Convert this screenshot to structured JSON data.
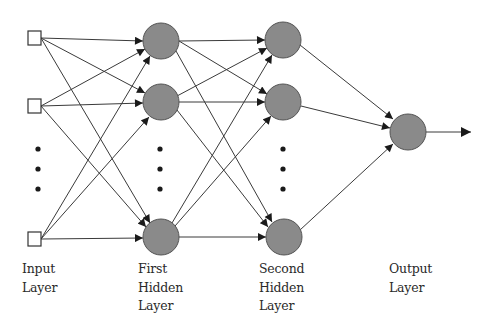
{
  "diagram": {
    "type": "feedforward-neural-network",
    "colors": {
      "neuron_fill": "#8a8a8a",
      "neuron_stroke": "#555555",
      "edge": "#3a3a3a",
      "input_fill": "#ffffff",
      "text": "#2a2a2a"
    },
    "layers": [
      {
        "id": "input",
        "label_lines": [
          "Input",
          "Layer"
        ],
        "node_shape": "square",
        "visible_nodes": 3,
        "has_ellipsis": true
      },
      {
        "id": "hidden1",
        "label_lines": [
          "First",
          "Hidden",
          "Layer"
        ],
        "node_shape": "circle",
        "visible_nodes": 3,
        "has_ellipsis": true
      },
      {
        "id": "hidden2",
        "label_lines": [
          "Second",
          "Hidden",
          "Layer"
        ],
        "node_shape": "circle",
        "visible_nodes": 3,
        "has_ellipsis": true
      },
      {
        "id": "output",
        "label_lines": [
          "Output",
          "Layer"
        ],
        "node_shape": "circle",
        "visible_nodes": 1,
        "has_ellipsis": false
      }
    ],
    "connections": "fully-connected",
    "output_arrow": true
  }
}
